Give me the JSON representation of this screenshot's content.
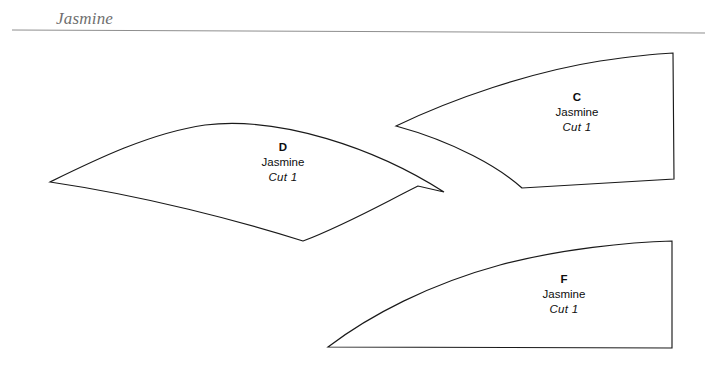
{
  "document": {
    "header_title": "Jasmine",
    "background_color": "#ffffff",
    "rule_color": "#8e8e8e",
    "outline_color": "#1a1a1a",
    "text_color": "#0d0d0d",
    "header_text_color": "#6f6f6f"
  },
  "pieces": [
    {
      "letter": "D",
      "name": "Jasmine",
      "cut": "Cut 1",
      "label_x": 283,
      "label_y": 140,
      "path": "M 50 182 C 95 160 150 133 205 125 C 280 116 375 148 444 192 L 418 186 C 380 205 345 225 303 241 C 240 221 145 196 50 182 Z"
    },
    {
      "letter": "C",
      "name": "Jasmine",
      "cut": "Cut 1",
      "label_x": 577,
      "label_y": 90,
      "path": "M 396 126 C 452 99 530 72 600 61 C 628 57 655 54 673 53 L 674 179 L 522 188 C 500 168 455 142 396 126 Z"
    },
    {
      "letter": "F",
      "name": "Jasmine",
      "cut": "Cut 1",
      "label_x": 564,
      "label_y": 272,
      "path": "M 328 347 C 370 315 430 284 500 265 C 560 249 630 242 672 241 L 672 348 L 328 347 Z"
    }
  ],
  "header_rule": {
    "x1": 12,
    "y1": 30,
    "x2": 705,
    "y2": 33
  }
}
